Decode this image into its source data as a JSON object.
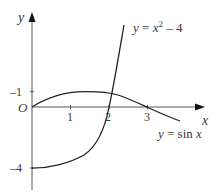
{
  "diagram": {
    "title": "",
    "axes": {
      "x_label": "x",
      "y_label": "y",
      "origin_label": "O",
      "x_ticks": [
        {
          "value": 1,
          "label": "1"
        },
        {
          "value": 2,
          "label": "2"
        },
        {
          "value": 3,
          "label": "3"
        }
      ],
      "y_ticks": [
        {
          "value": 1,
          "label": "–1"
        },
        {
          "value": -4,
          "label": "–4"
        }
      ]
    },
    "curves": [
      {
        "name": "parabola",
        "label_prefix": "y = x",
        "label_sup": "2",
        "label_suffix": " – 4",
        "expression": "x^2 - 4",
        "x_range": [
          0,
          2.45
        ]
      },
      {
        "name": "sine",
        "label": "y = sin x",
        "expression": "sin x",
        "x_range": [
          0,
          3.6
        ]
      }
    ],
    "colors": {
      "axis": "#555555",
      "curve": "#222222",
      "text": "#3a3a3a"
    }
  }
}
